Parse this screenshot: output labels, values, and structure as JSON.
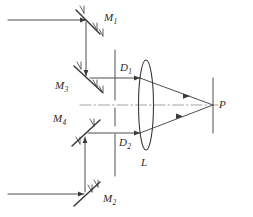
{
  "figure": {
    "type": "optical-ray-diagram",
    "stroke_color": "#3a3a3a",
    "background_color": "#ffffff"
  },
  "labels": {
    "mirror_1": {
      "base": "M",
      "sub": "1"
    },
    "mirror_2": {
      "base": "M",
      "sub": "2"
    },
    "mirror_3": {
      "base": "M",
      "sub": "3"
    },
    "mirror_4": {
      "base": "M",
      "sub": "4"
    },
    "aperture_1": {
      "base": "D",
      "sub": "1"
    },
    "aperture_2": {
      "base": "D",
      "sub": "2"
    },
    "lens": {
      "base": "L",
      "sub": ""
    },
    "point_p": {
      "base": "P",
      "sub": ""
    }
  },
  "elements": {
    "mirror_1": {
      "name": "M1",
      "x": 88,
      "y": 22,
      "tilt": "down-right"
    },
    "mirror_2": {
      "name": "M2",
      "x": 85,
      "y": 194,
      "tilt": "up-right"
    },
    "mirror_3": {
      "name": "M3",
      "x": 88,
      "y": 80,
      "tilt": "down-right"
    },
    "mirror_4": {
      "name": "M4",
      "x": 85,
      "y": 133,
      "tilt": "up-right"
    },
    "aperture_plane": {
      "name": "D-stop-plane",
      "x": 115,
      "y_top": 50,
      "y_bottom": 176
    },
    "lens": {
      "name": "L",
      "cx": 146,
      "cy": 105,
      "rx": 7,
      "ry": 45
    },
    "screen": {
      "name": "screen",
      "x": 213,
      "y_top": 78,
      "y_bottom": 133
    },
    "focus_point": {
      "name": "P",
      "x": 213,
      "y": 105
    }
  },
  "rays": {
    "input_top": {
      "from_x": 8,
      "to_x": 88,
      "y": 20
    },
    "input_bottom": {
      "from_x": 8,
      "to_x": 85,
      "y": 194
    },
    "vertical_top": {
      "x": 86,
      "from_y": 22,
      "to_y": 78
    },
    "vertical_bottom": {
      "x": 85,
      "from_y": 192,
      "to_y": 135
    },
    "beam_upper": {
      "from_x": 90,
      "to_x": 213,
      "y_start": 78,
      "y_end": 105
    },
    "beam_lower": {
      "from_x": 88,
      "to_x": 213,
      "y_start": 133,
      "y_end": 105
    },
    "optical_axis": {
      "from_x": 80,
      "to_x": 218,
      "y": 105
    }
  }
}
